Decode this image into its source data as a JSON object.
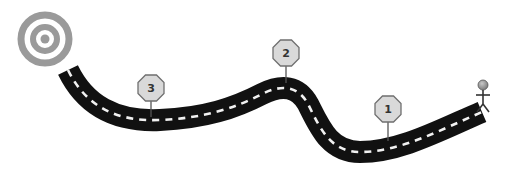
{
  "diagram": {
    "type": "roadmap",
    "goal": {
      "icon": "target-icon",
      "color": "#9a9a9a"
    },
    "start": {
      "icon": "person-icon",
      "color": "#333333",
      "head_color": "#8a8a8a"
    },
    "road": {
      "color": "#111111",
      "stripe_color": "#f2f2f2"
    },
    "milestones": [
      {
        "label": "1",
        "order": 1
      },
      {
        "label": "2",
        "order": 2
      },
      {
        "label": "3",
        "order": 3
      }
    ],
    "sign_fill": "#d9d9d9",
    "sign_stroke": "#6f6f6f"
  }
}
